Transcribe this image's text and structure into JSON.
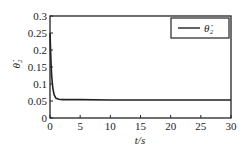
{
  "chart_data": {
    "type": "line",
    "title": "",
    "xlabel": "t/s",
    "ylabel": "θ̇₂",
    "xlim": [
      0,
      30
    ],
    "ylim": [
      0,
      0.3
    ],
    "xticks": [
      0,
      5,
      10,
      15,
      20,
      25,
      30
    ],
    "yticks": [
      0,
      0.05,
      0.1,
      0.15,
      0.2,
      0.25,
      0.3
    ],
    "xtick_labels": [
      "0",
      "5",
      "10",
      "15",
      "20",
      "25",
      "30"
    ],
    "ytick_labels": [
      "0",
      "0.05",
      "0.1",
      "0.15",
      "0.2",
      "0.25",
      "0.3"
    ],
    "grid": false,
    "legend_position": "upper right",
    "series": [
      {
        "name": "θ̇₂",
        "color": "#222222",
        "x": [
          0,
          0.1,
          0.2,
          0.3,
          0.4,
          0.5,
          0.7,
          1.0,
          1.5,
          2,
          3,
          5,
          10,
          15,
          20,
          25,
          30
        ],
        "values": [
          0.25,
          0.2,
          0.15,
          0.12,
          0.1,
          0.085,
          0.068,
          0.058,
          0.055,
          0.054,
          0.054,
          0.054,
          0.053,
          0.053,
          0.053,
          0.053,
          0.053
        ]
      }
    ]
  }
}
